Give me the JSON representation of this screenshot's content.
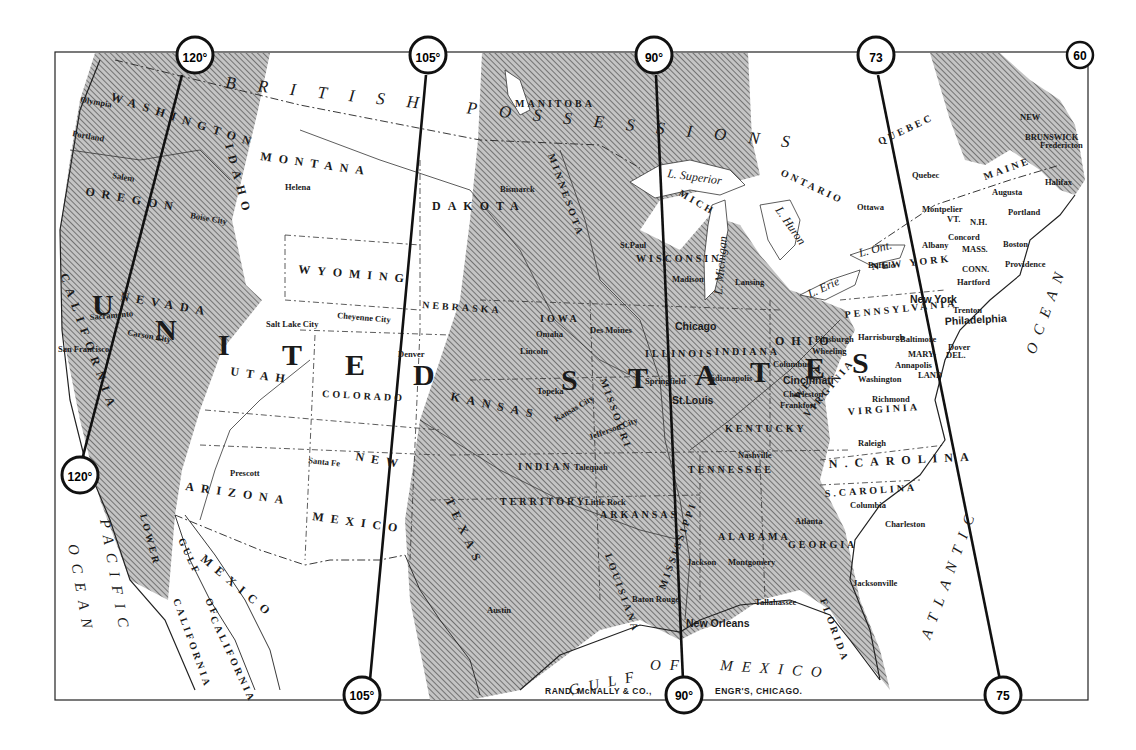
{
  "map": {
    "publisher": "RAND, McNALLY & CO.,",
    "engravers": "ENGR'S, CHICAGO.",
    "colors": {
      "paper": "#ffffff",
      "ink": "#1a1a1a",
      "hatch_fill": "#b9b9b9",
      "hatch_line": "#6a6a6a"
    },
    "meridians": [
      {
        "id": "120",
        "top_label": "120°",
        "bottom_label": "120°"
      },
      {
        "id": "105",
        "top_label": "105°",
        "bottom_label": "105°"
      },
      {
        "id": "90",
        "top_label": "90°",
        "bottom_label": "90°"
      },
      {
        "id": "75",
        "top_label": "73",
        "bottom_label": "75"
      },
      {
        "id": "60",
        "top_label": "60"
      }
    ],
    "big_words": {
      "united": [
        "U",
        "N",
        "I",
        "T",
        "E",
        "D"
      ],
      "states": [
        "S",
        "T",
        "A",
        "T",
        "E",
        "S"
      ]
    },
    "regions": {
      "british_possessions": "BRITISH POSSESSIONS",
      "mexico": "MEXICO",
      "pacific": "PACIFIC",
      "ocean_w": "OCEAN",
      "atlantic": "ATLANTIC",
      "ocean_e": "OCEAN",
      "gulf": "GULF",
      "of": "OF",
      "gulf_mexico": "MEXICO",
      "gulf_of_california_1": "GULF",
      "gulf_of_california_2": "OF",
      "gulf_of_california_3": "CALIFORNIA",
      "lower_california_1": "LOWER",
      "lower_california_2": "CALIFORNIA"
    },
    "provinces": {
      "manitoba": "MANITOBA",
      "ontario": "ONTARIO",
      "quebec": "QUEBEC",
      "new_brunswick_1": "NEW",
      "new_brunswick_2": "BRUNSWICK"
    },
    "states": {
      "washington": "WASHINGTON",
      "oregon": "OREGON",
      "idaho": "IDAHO",
      "montana": "MONTANA",
      "dakota": "DAKOTA",
      "wyoming": "WYOMING",
      "nebraska": "NEBRASKA",
      "iowa": "IOWA",
      "minnesota": "MINNESOTA",
      "wisconsin": "WISCONSIN",
      "michigan": "MICH",
      "nevada": "NEVADA",
      "california": "CALIFORNIA",
      "utah": "UTAH",
      "colorado": "COLORADO",
      "kansas": "KANSAS",
      "missouri": "MISSOURI",
      "illinois": "ILLINOIS",
      "indiana": "INDIANA",
      "ohio": "OHIO",
      "pennsylvania": "PENNSYLVANIA",
      "new_york": "NEW YORK",
      "arizona": "ARIZONA",
      "new_mexico_1": "NEW",
      "new_mexico_2": "MEXICO",
      "indian_territory_1": "INDIAN",
      "indian_territory_2": "TERRITORY",
      "arkansas": "ARKANSAS",
      "texas": "TEXAS",
      "kentucky": "KENTUCKY",
      "tennessee": "TENNESSEE",
      "west_virginia_1": "WEST",
      "west_virginia_2": "VIRGINIA",
      "virginia": "VIRGINIA",
      "n_carolina": "N.CAROLINA",
      "s_carolina": "S.CAROLINA",
      "georgia": "GEORGIA",
      "alabama": "ALABAMA",
      "mississippi": "MISSISSIPPI",
      "louisiana": "LOUISIANA",
      "florida": "FLORIDA",
      "maine": "MAINE",
      "vt": "VT.",
      "nh": "N.H.",
      "mass": "MASS.",
      "conn": "CONN.",
      "maryland_1": "MARY-",
      "maryland_2": "LAND",
      "del": "DEL."
    },
    "lakes": {
      "superior": "L. Superior",
      "michigan": "L. Michigan",
      "huron": "L. Huron",
      "erie": "L. Erie",
      "ontario": "L. Ont."
    },
    "cities": {
      "olympia": "Olympia",
      "portland_or": "Portland",
      "salem": "Salem",
      "boise": "Boise City",
      "helena": "Helena",
      "bismarck": "Bismarck",
      "sacramento": "Sacramento",
      "san_francisco": "San Francisco",
      "carson": "Carson City",
      "salt_lake": "Salt Lake City",
      "cheyenne": "Cheyenne City",
      "denver": "Denver",
      "santa_fe": "Santa Fe",
      "prescott": "Prescott",
      "omaha": "Omaha",
      "des_moines": "Des Moines",
      "lincoln": "Lincoln",
      "topeka": "Topeka",
      "kansas_city": "Kansas City",
      "jefferson_city": "Jefferson City",
      "tulequah": "Talequah",
      "little_rock": "Little Rock",
      "austin": "Austin",
      "baton_rouge": "Baton Rouge",
      "new_orleans": "New Orleans",
      "jackson": "Jackson",
      "montgomery": "Montgomery",
      "tallahassee": "Tallahassee",
      "atlanta": "Atlanta",
      "jacksonville": "Jacksonville",
      "st_paul": "St.Paul",
      "madison": "Madison",
      "lansing": "Lansing",
      "chicago": "Chicago",
      "springfield": "Springfield",
      "indianapolis": "Indianapolis",
      "st_louis": "St.Louis",
      "columbus": "Columbus",
      "cincinnati": "Cincinnati",
      "charleston_wv": "Charleston",
      "frankfort": "Frankfort",
      "nashville": "Nashville",
      "pittsburgh": "Pittsburgh",
      "wheeling": "Wheeling",
      "harrisburgh": "Harrisburgh",
      "baltimore": "Baltimore",
      "annapolis": "Annapolis",
      "washington": "Washington",
      "richmond": "Richmond",
      "raleigh": "Raleigh",
      "columbia": "Columbia",
      "charleston_sc": "Charleston",
      "philadelphia": "Philadelphia",
      "new_york": "New York",
      "trenton": "Trenton",
      "dover": "Dover",
      "hartford": "Hartford",
      "providence": "Providence",
      "boston": "Boston",
      "albany": "Albany",
      "concord": "Concord",
      "montpelier": "Montpelier",
      "augusta": "Augusta",
      "portland_me": "Portland",
      "buffalo": "Buffalo",
      "ottawa": "Ottawa",
      "quebec": "Quebec",
      "fredericton": "Fredericton",
      "halifax": "Halifax"
    }
  }
}
